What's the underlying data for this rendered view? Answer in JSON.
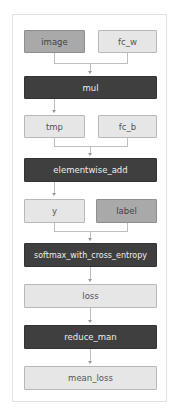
{
  "diagram": {
    "type": "computation-graph",
    "nodes": {
      "image": "image",
      "fc_w": "fc_w",
      "mul": "mul",
      "tmp": "tmp",
      "fc_b": "fc_b",
      "elementwise_add": "elementwise_add",
      "y": "y",
      "label": "label",
      "softmax": "softmax_with_cross_entropy",
      "loss": "loss",
      "reduce_man": "reduce_man",
      "mean_loss": "mean_loss"
    },
    "edges": [
      [
        "image",
        "mul"
      ],
      [
        "fc_w",
        "mul"
      ],
      [
        "mul",
        "tmp"
      ],
      [
        "tmp",
        "elementwise_add"
      ],
      [
        "fc_b",
        "elementwise_add"
      ],
      [
        "elementwise_add",
        "y"
      ],
      [
        "y",
        "softmax_with_cross_entropy"
      ],
      [
        "label",
        "softmax_with_cross_entropy"
      ],
      [
        "softmax_with_cross_entropy",
        "loss"
      ],
      [
        "loss",
        "reduce_man"
      ],
      [
        "reduce_man",
        "mean_loss"
      ]
    ],
    "colors": {
      "variable": "#e6e6e6",
      "input": "#a9a9a9",
      "operator": "#3f3f3f"
    }
  }
}
